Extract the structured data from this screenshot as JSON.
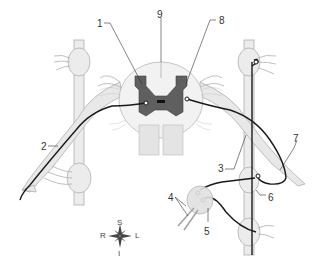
{
  "diagram": {
    "labels": [
      {
        "id": "1",
        "text": "1",
        "x": 97,
        "y": 19
      },
      {
        "id": "2",
        "text": "2",
        "x": 41,
        "y": 142
      },
      {
        "id": "3",
        "text": "3",
        "x": 218,
        "y": 164
      },
      {
        "id": "4",
        "text": "4",
        "x": 168,
        "y": 193
      },
      {
        "id": "5",
        "text": "5",
        "x": 204,
        "y": 227
      },
      {
        "id": "6",
        "text": "6",
        "x": 268,
        "y": 193
      },
      {
        "id": "7",
        "text": "7",
        "x": 293,
        "y": 134
      },
      {
        "id": "8",
        "text": "8",
        "x": 219,
        "y": 16
      },
      {
        "id": "9",
        "text": "9",
        "x": 157,
        "y": 10
      }
    ],
    "compass": {
      "top": "S",
      "left": "R",
      "right": "L",
      "bottom": "I"
    },
    "colors": {
      "gray_matter": "#5f5f5f",
      "white_matter": "#f2f2f2",
      "nerve_fill": "#e6e6e6",
      "nerve_outline": "#b5b5b5",
      "neuron_line": "#1a1a1a",
      "label_text": "#333333"
    }
  }
}
